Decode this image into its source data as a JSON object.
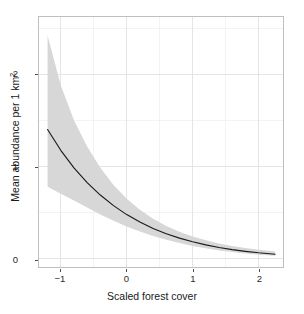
{
  "chart_data": {
    "type": "line",
    "title": "",
    "xlabel": "Scaled forest cover",
    "ylabel_text": "Mean abundance per 1 km",
    "ylabel_sup": "2",
    "ylabel_full": "Mean abundance per 1 km2",
    "xlim": [
      -1.33,
      2.37
    ],
    "ylim": [
      -0.09,
      2.62
    ],
    "xticks": [
      -1,
      0,
      1,
      2
    ],
    "xtick_labels": [
      "−1",
      "0",
      "1",
      "2"
    ],
    "yticks": [
      0,
      1,
      2
    ],
    "ytick_labels": [
      "0",
      "1",
      "2"
    ],
    "x_minor_gridlines": [
      -1.5,
      -0.5,
      0.5,
      1.5,
      2.0
    ],
    "y_minor_gridlines": [
      0.5,
      1.5,
      2.5
    ],
    "grid": true,
    "legend": "none",
    "colors": {
      "line": "#1a1a1a",
      "ribbon": "#d7d7d7",
      "panel_background": "#ffffff",
      "panel_border": "#bfbfbf",
      "major_gridline": "#e2e2e2",
      "minor_gridline": "#f0f0f0",
      "text": "#1a1a1a"
    },
    "series": [
      {
        "name": "Mean abundance",
        "x": [
          -1.2,
          -1.0,
          -0.8,
          -0.6,
          -0.4,
          -0.2,
          0.0,
          0.2,
          0.4,
          0.6,
          0.8,
          1.0,
          1.2,
          1.4,
          1.6,
          1.8,
          2.0,
          2.25
        ],
        "values": [
          1.4,
          1.175,
          0.985,
          0.825,
          0.69,
          0.575,
          0.478,
          0.397,
          0.328,
          0.271,
          0.223,
          0.183,
          0.15,
          0.122,
          0.099,
          0.08,
          0.064,
          0.048
        ],
        "ci_lower": [
          0.78,
          0.705,
          0.63,
          0.555,
          0.48,
          0.412,
          0.35,
          0.296,
          0.247,
          0.205,
          0.169,
          0.138,
          0.112,
          0.09,
          0.072,
          0.057,
          0.044,
          0.031
        ],
        "ci_upper": [
          2.42,
          1.88,
          1.5,
          1.215,
          0.985,
          0.8,
          0.65,
          0.53,
          0.432,
          0.355,
          0.292,
          0.242,
          0.2,
          0.166,
          0.138,
          0.115,
          0.096,
          0.077
        ]
      }
    ],
    "ribbon_label": "confidence-band"
  }
}
